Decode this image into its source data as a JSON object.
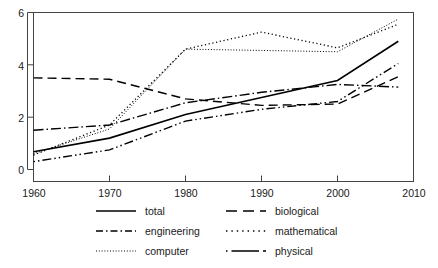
{
  "chart_data": {
    "type": "line",
    "title": "",
    "subtitle": "",
    "xlabel": "",
    "ylabel": "",
    "xlim": [
      1960,
      2010
    ],
    "ylim": [
      0,
      6
    ],
    "xticks": [
      1960,
      1970,
      1980,
      1990,
      2000,
      2010
    ],
    "yticks": [
      0,
      2,
      4,
      6
    ],
    "grid": false,
    "legend_position": "below-plot",
    "frame": true,
    "x": [
      1960,
      1970,
      1980,
      1990,
      2000,
      2008
    ],
    "series": [
      {
        "name": "total",
        "label": "total",
        "dash": "solid",
        "color": "#000000",
        "values": [
          0.68,
          1.2,
          2.1,
          2.75,
          3.4,
          4.9
        ]
      },
      {
        "name": "engineering",
        "label": "engineering",
        "dash": "dashdot",
        "color": "#000000",
        "values": [
          1.5,
          1.7,
          2.55,
          2.95,
          3.25,
          3.15
        ]
      },
      {
        "name": "computer",
        "label": "computer",
        "dash": "dotted-fine",
        "color": "#000000",
        "values": [
          0.6,
          1.55,
          4.6,
          4.55,
          4.5,
          5.75
        ]
      },
      {
        "name": "biological",
        "label": "biological",
        "dash": "dashed",
        "color": "#000000",
        "values": [
          3.5,
          3.45,
          2.7,
          2.45,
          2.5,
          3.55
        ]
      },
      {
        "name": "mathematical",
        "label": "mathematical",
        "dash": "dotted",
        "color": "#000000",
        "values": [
          0.55,
          1.7,
          4.6,
          5.25,
          4.65,
          5.55
        ]
      },
      {
        "name": "physical",
        "label": "physical",
        "dash": "dash-dot-long",
        "color": "#000000",
        "values": [
          0.3,
          0.75,
          1.85,
          2.3,
          2.6,
          4.05
        ]
      }
    ],
    "axis": {
      "y_tick_labels": [
        "0",
        "2",
        "4",
        "6"
      ],
      "x_tick_labels": [
        "1960",
        "1970",
        "1980",
        "1990",
        "2000",
        "2010"
      ]
    },
    "legend": {
      "entries": [
        {
          "label": "total",
          "style": "solid"
        },
        {
          "label": "biological",
          "style": "dashed"
        },
        {
          "label": "engineering",
          "style": "dashdot"
        },
        {
          "label": "mathematical",
          "style": "dotted"
        },
        {
          "label": "computer",
          "style": "dotted-fine"
        },
        {
          "label": "physical",
          "style": "dash-dot-long"
        }
      ]
    }
  }
}
